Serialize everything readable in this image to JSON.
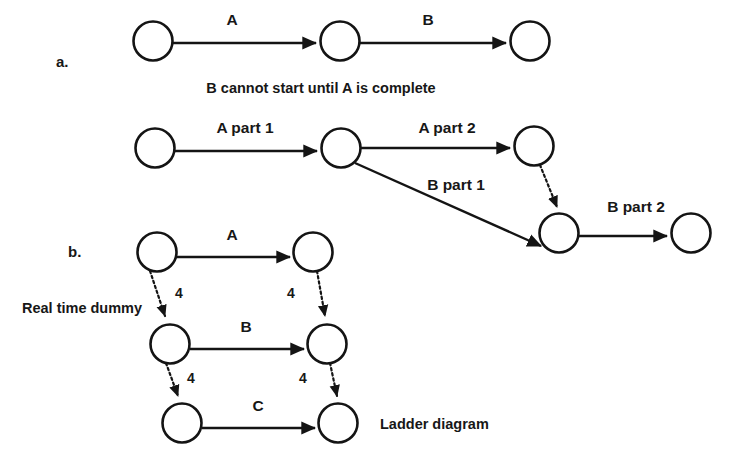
{
  "figure": {
    "background_color": "#ffffff",
    "ink_color": "#141414",
    "sections": [
      {
        "key": "a",
        "marker": "a.",
        "caption": "B cannot start until A is complete",
        "edge_labels": [
          "A",
          "B"
        ]
      },
      {
        "key": "b",
        "marker": "b.",
        "caption": "Ladder diagram",
        "note": "Real time dummy",
        "edge_labels": [
          "A",
          "B",
          "C"
        ],
        "dummy_labels": [
          "4",
          "4",
          "4",
          "4"
        ]
      }
    ],
    "middle_row_edge_labels": [
      "A part 1",
      "A part 2",
      "B part 1",
      "B part 2"
    ]
  },
  "labels": {
    "marker_a": "a.",
    "marker_b": "b.",
    "edge_a_top": "A",
    "edge_b_top": "B",
    "caption_top": "B cannot start until A is complete",
    "edge_a_part_1": "A part 1",
    "edge_a_part_2": "A part 2",
    "edge_b_part_1": "B part 1",
    "edge_b_part_2": "B part 2",
    "ladder_edge_a": "A",
    "ladder_edge_b": "B",
    "ladder_edge_c": "C",
    "dummy_top_left": "4",
    "dummy_top_right": "4",
    "dummy_bottom_left": "4",
    "dummy_bottom_right": "4",
    "real_time_dummy": "Real time dummy",
    "ladder_diagram": "Ladder diagram"
  }
}
